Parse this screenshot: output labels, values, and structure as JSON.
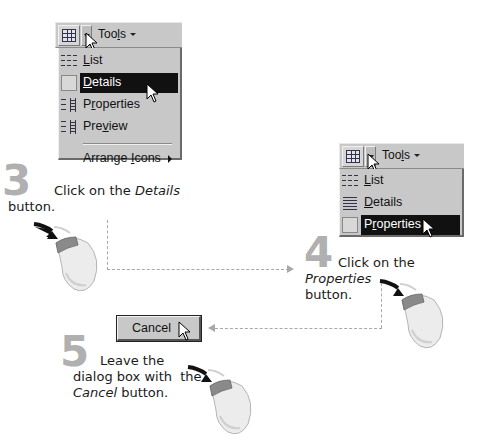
{
  "step3": {
    "number": "3",
    "text_before": "Click on the ",
    "text_em": "Details",
    "text_after": "button.",
    "toolbar": {
      "tools_label": "Tools",
      "tools_underline": "l",
      "view_icon": "grid-view-icon",
      "dropdown_icon": "dropdown-arrow-icon"
    },
    "menu": {
      "items": [
        {
          "pre": "",
          "u": "L",
          "post": "ist",
          "icon": "list-view-icon",
          "selected": false
        },
        {
          "pre": "",
          "u": "D",
          "post": "etails",
          "icon": "details-view-icon",
          "selected": true
        },
        {
          "pre": "P",
          "u": "r",
          "post": "operties",
          "icon": "properties-view-icon",
          "selected": false
        },
        {
          "pre": "Pre",
          "u": "v",
          "post": "iew",
          "icon": "preview-view-icon",
          "selected": false
        }
      ],
      "arrange": {
        "pre": "Arrange ",
        "u": "I",
        "post": "cons"
      }
    }
  },
  "step4": {
    "number": "4",
    "text_before": "Click on the ",
    "text_em": "Properties",
    "text_after": "button.",
    "toolbar": {
      "tools_label": "Tools",
      "tools_underline": "l"
    },
    "menu": {
      "items": [
        {
          "pre": "",
          "u": "L",
          "post": "ist",
          "icon": "list-view-icon",
          "selected": false
        },
        {
          "pre": "",
          "u": "D",
          "post": "etails",
          "icon": "details-view-icon",
          "selected": false
        },
        {
          "pre": "P",
          "u": "r",
          "post": "operties",
          "icon": "properties-view-icon",
          "selected": true
        }
      ]
    }
  },
  "step5": {
    "number": "5",
    "line1": "Leave the",
    "line2": "dialog box with  the",
    "text_em": "Cancel",
    "text_after": " button.",
    "button_label": "Cancel"
  },
  "colors": {
    "menu_bg": "#c8c8c8",
    "highlight": "#111111",
    "step_number": "#b0b0b0",
    "connector": "#a8a8a8",
    "mouse_button": "#8a8a8a"
  }
}
